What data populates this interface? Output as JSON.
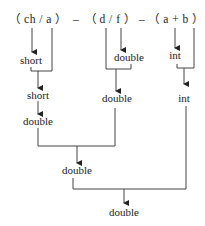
{
  "diagram": {
    "expression": {
      "part1": "（ ch / a ）",
      "op1": "–",
      "part2": "（ d / f ）",
      "op2": "–",
      "part3": "（ a + b ）"
    },
    "nodes": {
      "ch_result": "short",
      "ch_a_result": "short",
      "short_to_double": "double",
      "df_f_result": "double",
      "df_result": "double",
      "ab_a_result": "int",
      "ab_result": "int",
      "sub1_result": "double",
      "final_result": "double"
    },
    "colors": {
      "line": "#333333",
      "text": "#222222",
      "background": "#ffffff"
    }
  }
}
